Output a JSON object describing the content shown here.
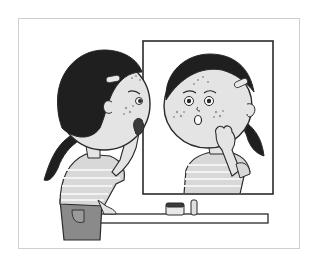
{
  "illustration": {
    "caption": "Girl looking in a mirror at acne on her face",
    "frame": {
      "x": 18,
      "y": 18,
      "w": 281,
      "h": 230,
      "border": "#c8c8c8"
    },
    "colors": {
      "line": "#2a2a2a",
      "hair": "#1f1f1f",
      "skin": "#e4e4e4",
      "shirt": "#d8d8d8",
      "shirt_stripe": "#f2f2f2",
      "pants": "#8a8a8a",
      "spots": "#9a9a9a",
      "background": "#ffffff"
    },
    "elements": {
      "girl": "Girl seen from behind-side, hand on chin, ponytail",
      "mirror": "Rectangular mirror showing worried reflection with spots",
      "shelf": "Shelf under mirror",
      "jar": "Cream jar",
      "tube": "Small tube / lip balm"
    }
  }
}
